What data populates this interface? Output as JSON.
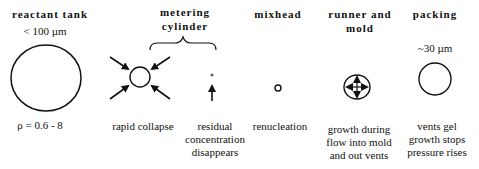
{
  "stages": [
    {
      "id": "reactant-tank",
      "header": "reactant tank",
      "size": "< 100 µm",
      "extra": "ρ = 0.6 - 8",
      "caption": []
    },
    {
      "id": "metering-cylinder",
      "header_line1": "metering",
      "header_line2": "cylinder",
      "sub": [
        {
          "caption": [
            "rapid collapse"
          ]
        },
        {
          "caption": [
            "residual",
            "concentration",
            "disappears"
          ]
        }
      ]
    },
    {
      "id": "mixhead",
      "header": "mixhead",
      "caption": [
        "renucleation"
      ]
    },
    {
      "id": "runner-and-mold",
      "header_line1": "runner and",
      "header_line2": "mold",
      "caption": [
        "growth during",
        "flow into mold",
        "and out vents"
      ]
    },
    {
      "id": "packing",
      "header": "packing",
      "size": "~30 µm",
      "caption": [
        "vents gel",
        "growth stops",
        "pressure rises"
      ]
    }
  ]
}
